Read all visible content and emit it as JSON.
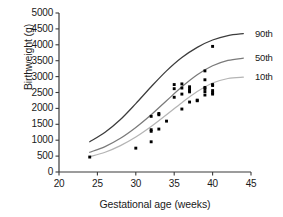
{
  "chart_data": {
    "type": "line",
    "title": "",
    "xlabel": "Gestational age (weeks)",
    "ylabel": "Birthweight (g)",
    "xlim": [
      20,
      45
    ],
    "ylim": [
      0,
      5000
    ],
    "xticks": [
      20,
      25,
      30,
      35,
      40,
      45
    ],
    "yticks": [
      0,
      500,
      1000,
      1500,
      2000,
      2500,
      3000,
      3500,
      4000,
      4500,
      5000
    ],
    "grid": false,
    "legend_position": "right-of-curve-ends",
    "series": [
      {
        "name": "90th",
        "label": "90th",
        "type": "line",
        "color": "#3c3c3c",
        "x": [
          24,
          26,
          28,
          30,
          32,
          34,
          36,
          38,
          40,
          42,
          44
        ],
        "values": [
          950,
          1250,
          1650,
          2150,
          2680,
          3180,
          3600,
          3920,
          4150,
          4290,
          4350
        ]
      },
      {
        "name": "50th",
        "label": "50th",
        "type": "line",
        "color": "#7a7a7a",
        "x": [
          24,
          26,
          28,
          30,
          32,
          34,
          36,
          38,
          40,
          42,
          44
        ],
        "values": [
          620,
          800,
          1060,
          1400,
          1800,
          2240,
          2680,
          3060,
          3340,
          3510,
          3580
        ]
      },
      {
        "name": "10th",
        "label": "10th",
        "type": "line",
        "color": "#b4b4b4",
        "x": [
          24,
          26,
          28,
          30,
          32,
          34,
          36,
          38,
          40,
          42,
          44
        ],
        "values": [
          480,
          620,
          830,
          1100,
          1430,
          1800,
          2180,
          2530,
          2800,
          2940,
          2980
        ]
      },
      {
        "name": "Observed births",
        "label": "",
        "type": "scatter",
        "color": "#000000",
        "points": [
          [
            24,
            470
          ],
          [
            30,
            750
          ],
          [
            32,
            950
          ],
          [
            32,
            1280
          ],
          [
            32,
            1330
          ],
          [
            32,
            1750
          ],
          [
            33,
            1350
          ],
          [
            33,
            1800
          ],
          [
            33,
            1840
          ],
          [
            34,
            1600
          ],
          [
            35,
            2350
          ],
          [
            35,
            2620
          ],
          [
            35,
            2750
          ],
          [
            36,
            1980
          ],
          [
            36,
            2450
          ],
          [
            36,
            2640
          ],
          [
            36,
            2770
          ],
          [
            37,
            2200
          ],
          [
            37,
            2520
          ],
          [
            37,
            2560
          ],
          [
            37,
            2620
          ],
          [
            37,
            2680
          ],
          [
            38,
            2240
          ],
          [
            38,
            2260
          ],
          [
            39,
            2420
          ],
          [
            39,
            2530
          ],
          [
            39,
            2620
          ],
          [
            39,
            2660
          ],
          [
            39,
            2900
          ],
          [
            39,
            3180
          ],
          [
            40,
            2450
          ],
          [
            40,
            2490
          ],
          [
            40,
            2560
          ],
          [
            40,
            2720
          ],
          [
            40,
            2750
          ],
          [
            40,
            3950
          ]
        ]
      }
    ]
  },
  "axes": {
    "y_title": "Birthweight (g)",
    "x_title": "Gestational age (weeks)",
    "y_tick_labels": [
      "5000",
      "4500",
      "4000",
      "3500",
      "3000",
      "2500",
      "2000",
      "1500",
      "1000",
      "500",
      "0"
    ],
    "x_tick_labels": [
      "20",
      "25",
      "30",
      "35",
      "40",
      "45"
    ]
  },
  "legend": {
    "items": [
      {
        "label": "90th"
      },
      {
        "label": "50th"
      },
      {
        "label": "10th"
      }
    ]
  },
  "colors": {
    "axis": "#3a3a3a",
    "p90": "#3c3c3c",
    "p50": "#7a7a7a",
    "p10": "#b4b4b4",
    "point": "#000000",
    "background": "#ffffff"
  }
}
